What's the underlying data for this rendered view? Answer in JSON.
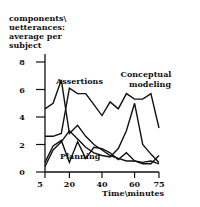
{
  "chart_data": {
    "type": "line",
    "title": "",
    "xlabel": "Time\\minutes",
    "ylabel": "components\\ uetterances: average per subject",
    "ylabel_lines": [
      "components\\",
      "uetterances:",
      "average per",
      "subject"
    ],
    "xlim": [
      5,
      75
    ],
    "ylim": [
      0,
      8
    ],
    "x_ticks": [
      5,
      20,
      40,
      60,
      75
    ],
    "y_ticks": [
      0,
      2,
      4,
      6,
      8
    ],
    "grid": false,
    "legend": "inline annotations",
    "annotations": [
      "Assertions",
      "Conceptual",
      "modeling",
      "Planning"
    ],
    "x": [
      5,
      10,
      15,
      20,
      25,
      30,
      35,
      40,
      45,
      50,
      55,
      60,
      65,
      70,
      75
    ],
    "series": [
      {
        "name": "Assertions",
        "values": [
          4.6,
          5.0,
          6.7,
          2.8,
          3.4,
          2.6,
          2.0,
          1.6,
          1.2,
          1.0,
          0.8,
          0.8,
          0.7,
          0.8,
          0.6
        ]
      },
      {
        "name": "Assertions (second peak)",
        "values": [
          2.6,
          2.6,
          2.8,
          6.1,
          5.7,
          5.7,
          4.9,
          4.1,
          5.1,
          4.6,
          5.7,
          5.3,
          5.3,
          5.7,
          3.2
        ]
      },
      {
        "name": "Planning",
        "values": [
          0.7,
          1.9,
          2.3,
          0.7,
          2.2,
          1.0,
          1.8,
          1.7,
          1.4,
          0.9,
          1.4,
          0.8,
          0.6,
          0.6,
          1.2
        ]
      },
      {
        "name": "Conceptual modeling",
        "values": [
          0.4,
          1.6,
          2.2,
          3.0,
          2.4,
          1.8,
          1.4,
          1.2,
          1.1,
          1.7,
          3.0,
          5.0,
          2.0,
          1.3,
          0.7
        ]
      }
    ]
  }
}
